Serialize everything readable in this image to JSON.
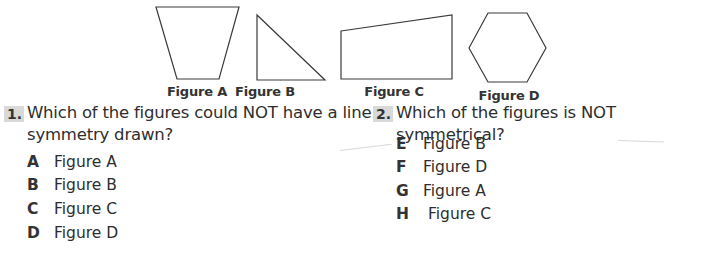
{
  "figures": [
    {
      "id": "A",
      "label": "Figure A",
      "shape": "trapezoid"
    },
    {
      "id": "B",
      "label": "Figure B",
      "shape": "right-triangle"
    },
    {
      "id": "C",
      "label": "Figure C",
      "shape": "irregular-quadrilateral"
    },
    {
      "id": "D",
      "label": "Figure D",
      "shape": "regular-hexagon"
    }
  ],
  "questions": [
    {
      "number": "1.",
      "text": "Which of the figures could NOT have a line of symmetry drawn?",
      "text_line1": "Which of the figures could NOT have a line of",
      "text_line2": "symmetry drawn?",
      "options": [
        {
          "letter": "A",
          "label": "Figure A"
        },
        {
          "letter": "B",
          "label": "Figure B"
        },
        {
          "letter": "C",
          "label": "Figure C"
        },
        {
          "letter": "D",
          "label": "Figure D"
        }
      ]
    },
    {
      "number": "2.",
      "text": "Which of the figures is NOT symmetrical?",
      "options": [
        {
          "letter": "E",
          "label": "Figure B"
        },
        {
          "letter": "F",
          "label": "Figure D"
        },
        {
          "letter": "G",
          "label": "Figure A"
        },
        {
          "letter": "H",
          "label": "Figure C"
        }
      ]
    }
  ]
}
